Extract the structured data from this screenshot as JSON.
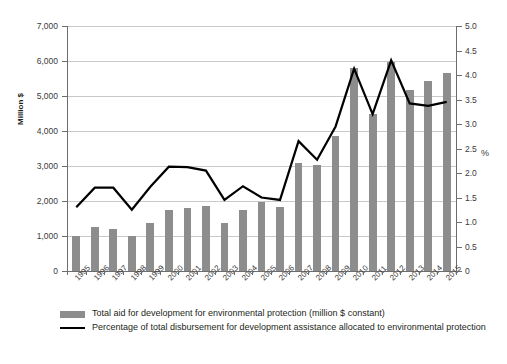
{
  "chart_data": {
    "type": "bar",
    "title": "",
    "xlabel": "",
    "ylabel": "Million $",
    "y2label": "%",
    "grid": true,
    "legend_position": "bottom-left",
    "categories": [
      "1995",
      "1996",
      "1997",
      "1998",
      "1999",
      "2000",
      "2001",
      "2002",
      "2003",
      "2004",
      "2005",
      "2006",
      "2007",
      "2008",
      "2009",
      "2010",
      "2011",
      "2012",
      "2013",
      "2014",
      "2015"
    ],
    "ylim": [
      0,
      7000
    ],
    "yticks": [
      "0",
      "1,000",
      "2,000",
      "3,000",
      "4,000",
      "5,000",
      "6,000",
      "7,000"
    ],
    "ytick_values": [
      0,
      1000,
      2000,
      3000,
      4000,
      5000,
      6000,
      7000
    ],
    "y2lim": [
      0,
      5.0
    ],
    "y2ticks": [
      "0",
      "0.5",
      "1.0",
      "1.5",
      "2.0",
      "2.5",
      "3.0",
      "3.5",
      "4.0",
      "4.5",
      "5.0"
    ],
    "y2tick_values": [
      0,
      0.5,
      1.0,
      1.5,
      2.0,
      2.5,
      3.0,
      3.5,
      4.0,
      4.5,
      5.0
    ],
    "series": [
      {
        "name": "Total aid for development for environmental protection (million $ constant)",
        "type": "bar",
        "axis": "left",
        "color": "#8d8d8d",
        "values": [
          1000,
          1270,
          1200,
          1000,
          1380,
          1740,
          1810,
          1870,
          1360,
          1740,
          1960,
          1820,
          3080,
          3020,
          3870,
          5790,
          4480,
          5980,
          5180,
          5420,
          5670
        ]
      },
      {
        "name": "Percentage of total disbursement for development assistance allocated to environmental protection",
        "type": "line",
        "axis": "right",
        "color": "#000000",
        "values": [
          1.3,
          1.7,
          1.7,
          1.25,
          1.72,
          2.13,
          2.12,
          2.05,
          1.45,
          1.73,
          1.5,
          1.45,
          2.65,
          2.27,
          2.95,
          4.13,
          3.2,
          4.3,
          3.42,
          3.37,
          3.45
        ]
      }
    ]
  },
  "legend": {
    "bar_label": "Total aid for development for environmental protection (million $ constant)",
    "line_label": "Percentage of total disbursement for development assistance allocated to environmental protection"
  }
}
